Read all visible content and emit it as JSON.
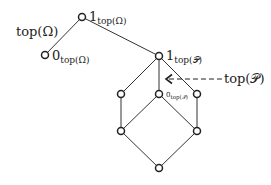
{
  "diagram": {
    "labels": {
      "top_omega": "top(Ω)",
      "one_omega_main": "1",
      "one_omega_sub": "top(Ω)",
      "zero_omega_main": "0",
      "zero_omega_sub": "top(Ω)",
      "one_p_main": "1",
      "one_p_sub": "top(𝒫)",
      "zero_p_main": "0",
      "zero_p_sub": "top(𝒫)",
      "top_p": "top(𝒫)"
    },
    "nodes": [
      {
        "id": "one_omega",
        "x": 82,
        "y": 17
      },
      {
        "id": "zero_omega",
        "x": 45,
        "y": 55
      },
      {
        "id": "one_p",
        "x": 159,
        "y": 56
      },
      {
        "id": "mid_left",
        "x": 121,
        "y": 94
      },
      {
        "id": "zero_p",
        "x": 159,
        "y": 94
      },
      {
        "id": "mid_right",
        "x": 197,
        "y": 94
      },
      {
        "id": "low_left",
        "x": 121,
        "y": 131
      },
      {
        "id": "low_right",
        "x": 197,
        "y": 131
      },
      {
        "id": "bottom",
        "x": 159,
        "y": 168
      }
    ],
    "edges": [
      [
        "one_omega",
        "zero_omega"
      ],
      [
        "one_omega",
        "one_p"
      ],
      [
        "one_p",
        "mid_left"
      ],
      [
        "one_p",
        "zero_p"
      ],
      [
        "one_p",
        "mid_right"
      ],
      [
        "mid_left",
        "low_left"
      ],
      [
        "zero_p",
        "low_left"
      ],
      [
        "zero_p",
        "low_right"
      ],
      [
        "mid_right",
        "low_right"
      ],
      [
        "low_left",
        "bottom"
      ],
      [
        "low_right",
        "bottom"
      ]
    ]
  }
}
